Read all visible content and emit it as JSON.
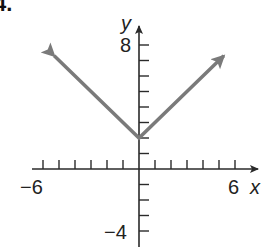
{
  "problem_label": "4.",
  "colors": {
    "axis": "#2a2a2a",
    "graph_line": "#7a7a7a",
    "background": "#ffffff"
  },
  "chart_data": {
    "type": "line",
    "title": "",
    "xlabel": "x",
    "ylabel": "y",
    "xlim": [
      -6,
      6
    ],
    "ylim": [
      -4,
      8
    ],
    "x_tick_labels": [
      "-6",
      "6"
    ],
    "y_tick_labels": [
      "8",
      "-4"
    ],
    "x_ticks": [
      -6,
      -5,
      -4,
      -3,
      -2,
      -1,
      1,
      2,
      3,
      4,
      5,
      6
    ],
    "y_ticks": [
      -4,
      -3,
      -2,
      -1,
      1,
      2,
      3,
      4,
      5,
      6,
      7,
      8
    ],
    "grid": false,
    "legend": null,
    "series": [
      {
        "name": "y = |x| + 2",
        "points": [
          [
            -5.3,
            7.3
          ],
          [
            0,
            2
          ],
          [
            5.3,
            7.3
          ]
        ],
        "arrows": "both_ends",
        "vertex": [
          0,
          2
        ]
      }
    ],
    "axis_labels_display": {
      "x_min": "−6",
      "x_max": "6",
      "y_max": "8",
      "y_min": "−4",
      "x_name": "x",
      "y_name": "y"
    }
  }
}
